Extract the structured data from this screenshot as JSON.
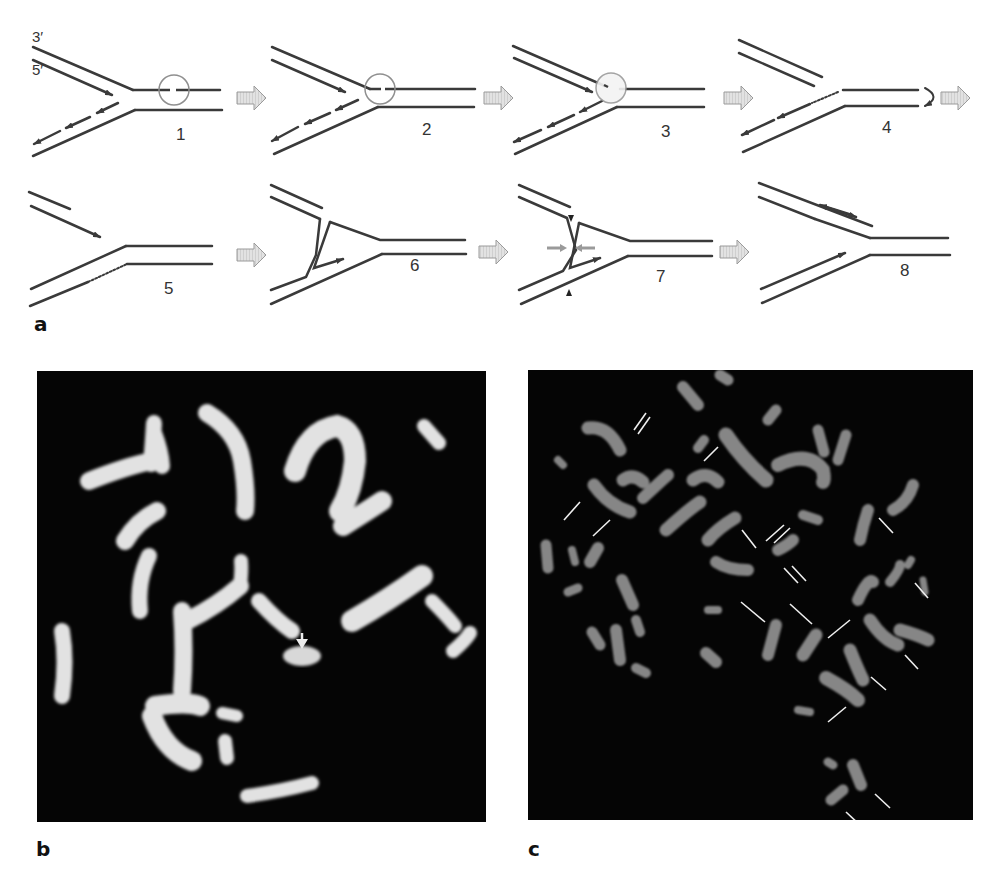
{
  "figure": {
    "panel_a": {
      "label": "a",
      "strand_labels": {
        "top": "3′",
        "bottom": "5′"
      },
      "steps": [
        {
          "number": "1"
        },
        {
          "number": "2"
        },
        {
          "number": "3"
        },
        {
          "number": "4"
        },
        {
          "number": "5"
        },
        {
          "number": "6"
        },
        {
          "number": "7"
        },
        {
          "number": "8"
        }
      ]
    },
    "panel_b": {
      "label": "b"
    },
    "panel_c": {
      "label": "c"
    }
  },
  "colors": {
    "strand": "#3a3a3a",
    "arrow_fill": "#d9d9d9",
    "arrow_stroke": "#9a9a9a",
    "micrograph_bg": "#050505",
    "chromosome_b": "#e4e4e4",
    "chromosome_c": "#8a8a8a"
  }
}
